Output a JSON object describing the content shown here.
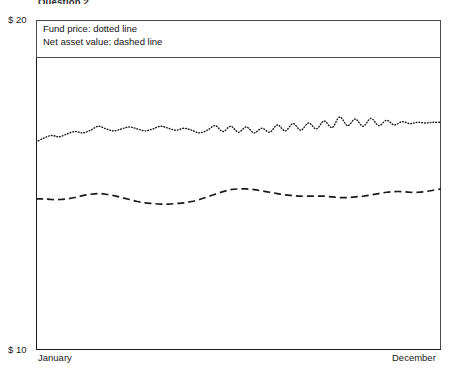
{
  "header": {
    "title": "Question 2"
  },
  "legend": {
    "entries": [
      {
        "label": "Fund price: dotted line",
        "series": "fund_price",
        "style": "dotted"
      },
      {
        "label": "Net asset value: dashed line",
        "series": "net_asset_value",
        "style": "dashed"
      }
    ]
  },
  "axes": {
    "y_top_label": "$ 20",
    "y_bottom_label": "$ 10",
    "x_start_label": "January",
    "x_end_label": "December"
  },
  "chart_data": {
    "type": "line",
    "title": "Question 2",
    "xlabel": "",
    "ylabel": "",
    "ylim": [
      10,
      20
    ],
    "xlim": [
      0,
      52
    ],
    "grid": false,
    "legend_position": "top-left-inside-box",
    "y_ticks": [
      10,
      20
    ],
    "y_tick_labels": [
      "$ 10",
      "$ 20"
    ],
    "x_ticks": [
      0,
      52
    ],
    "x_tick_labels": [
      "January",
      "December"
    ],
    "x_unit": "week",
    "annotations": [
      "Fund price: dotted line",
      "Net asset value: dashed line"
    ],
    "series": [
      {
        "name": "Fund price",
        "style": "dotted",
        "color": "#1a1a1a",
        "values": [
          16.3,
          16.42,
          16.5,
          16.46,
          16.55,
          16.62,
          16.58,
          16.66,
          16.78,
          16.7,
          16.64,
          16.7,
          16.76,
          16.7,
          16.64,
          16.7,
          16.78,
          16.72,
          16.66,
          16.72,
          16.66,
          16.58,
          16.66,
          16.8,
          16.62,
          16.78,
          16.6,
          16.76,
          16.58,
          16.72,
          16.6,
          16.82,
          16.64,
          16.86,
          16.66,
          16.88,
          16.7,
          16.94,
          16.74,
          17.06,
          16.8,
          17.0,
          16.78,
          17.02,
          16.8,
          16.96,
          16.82,
          16.92,
          16.86,
          16.9,
          16.88,
          16.9,
          16.9
        ]
      },
      {
        "name": "Net asset value",
        "style": "dashed",
        "color": "#1a1a1a",
        "values": [
          14.58,
          14.58,
          14.56,
          14.56,
          14.58,
          14.62,
          14.68,
          14.72,
          14.74,
          14.72,
          14.68,
          14.62,
          14.56,
          14.5,
          14.46,
          14.44,
          14.42,
          14.42,
          14.44,
          14.46,
          14.5,
          14.56,
          14.64,
          14.72,
          14.8,
          14.86,
          14.88,
          14.88,
          14.86,
          14.82,
          14.78,
          14.74,
          14.7,
          14.68,
          14.66,
          14.66,
          14.66,
          14.66,
          14.64,
          14.62,
          14.62,
          14.64,
          14.66,
          14.7,
          14.74,
          14.78,
          14.8,
          14.8,
          14.78,
          14.78,
          14.8,
          14.84,
          14.88
        ]
      }
    ]
  },
  "colors": {
    "line": "#1a1a1a",
    "frame": "#4a4a4a",
    "background": "#ffffff"
  }
}
